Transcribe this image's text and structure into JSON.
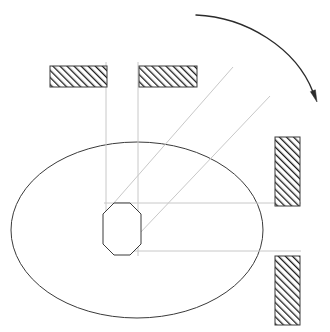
{
  "canvas": {
    "width": 330,
    "height": 332,
    "background": "#ffffff",
    "title": "Mechanism Kinematic Diagram"
  },
  "style": {
    "outline_color": "#3a3a3a",
    "hatch_color": "#1a1a1a",
    "guide_color": "#c8c8c8",
    "arrow_color": "#2b2b2b",
    "fill_white": "#ffffff",
    "outline_width": 1,
    "guide_width": 1,
    "hatch_width": 2,
    "hatch_spacing": 5,
    "hatch_angle_deg": -45
  },
  "shapes": {
    "ellipse": {
      "label": "cam-disc-outline",
      "cx": 137,
      "cy": 230,
      "rx": 126,
      "ry": 88,
      "stroke": "#3a3a3a",
      "fill": "none"
    },
    "octagon": {
      "label": "hub-octagon",
      "cx": 122,
      "cy": 229,
      "x": 103,
      "y": 203,
      "width": 38,
      "height": 52,
      "corner_cut": 11,
      "stroke": "#3a3a3a",
      "fill": "#ffffff"
    }
  },
  "hatched_blocks": [
    {
      "id": "block-top-left",
      "label": "Upper left guide block",
      "x": 50,
      "y": 66,
      "width": 57,
      "height": 21,
      "orientation": "horizontal"
    },
    {
      "id": "block-top-right",
      "label": "Upper right guide block",
      "x": 139,
      "y": 66,
      "width": 58,
      "height": 21,
      "orientation": "horizontal"
    },
    {
      "id": "block-right-upper",
      "label": "Right upper guide block",
      "x": 275,
      "y": 137,
      "width": 25,
      "height": 69,
      "orientation": "vertical"
    },
    {
      "id": "block-right-lower",
      "label": "Right lower guide block",
      "x": 275,
      "y": 256,
      "width": 25,
      "height": 69,
      "orientation": "vertical"
    }
  ],
  "guide_lines": [
    {
      "id": "guide-vertical-left",
      "label": "Left vertical slider axis",
      "x1": 106,
      "y1": 62,
      "x2": 106,
      "y2": 211
    },
    {
      "id": "guide-vertical-right",
      "label": "Right vertical slider axis",
      "x1": 138,
      "y1": 62,
      "x2": 138,
      "y2": 256
    },
    {
      "id": "guide-horizontal-upper",
      "label": "Upper horizontal slider axis",
      "x1": 104,
      "y1": 203,
      "x2": 301,
      "y2": 203
    },
    {
      "id": "guide-horizontal-lower",
      "label": "Lower horizontal slider axis",
      "x1": 121,
      "y1": 251,
      "x2": 301,
      "y2": 251
    },
    {
      "id": "guide-diagonal-upper",
      "label": "Upper diagonal link line",
      "x1": 106,
      "y1": 212,
      "x2": 233,
      "y2": 67
    },
    {
      "id": "guide-diagonal-lower",
      "label": "Lower diagonal link line",
      "x1": 120,
      "y1": 254,
      "x2": 270,
      "y2": 96
    }
  ],
  "rotation_arrow": {
    "id": "rotation-direction-arrow",
    "label": "Direction of rotation",
    "path": "M 196 15 C 246 17, 296 48, 313 92",
    "head": {
      "x": 317,
      "y": 102,
      "angle_deg": 70,
      "size": 12
    },
    "stroke": "#2b2b2b",
    "stroke_width": 1.4
  }
}
